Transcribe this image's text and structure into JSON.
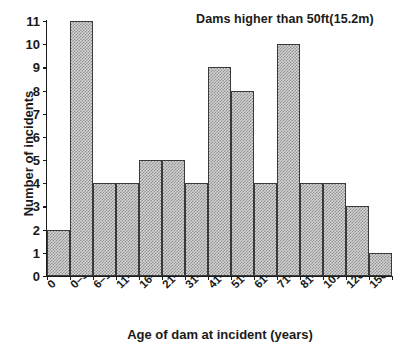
{
  "chart_data": {
    "type": "bar",
    "title": "Dams higher than 50ft(15.2m)",
    "xlabel": "Age of dam at incident (years)",
    "ylabel": "Number of incidents",
    "categories": [
      "0",
      "0–5",
      "6–10",
      "11–15",
      "16–20",
      "21–30",
      "31–40",
      "41–50",
      "51–60",
      "61–70",
      "71–80",
      "81–100",
      "101–125",
      "126–150",
      "150"
    ],
    "values": [
      2,
      11,
      4,
      4,
      5,
      5,
      4,
      9,
      8,
      4,
      10,
      4,
      4,
      3,
      1
    ],
    "ylim": [
      0,
      11
    ],
    "xlim": [
      0,
      15
    ],
    "yticks": [
      0,
      1,
      2,
      3,
      4,
      5,
      6,
      7,
      8,
      9,
      10,
      11
    ],
    "ytick_labels": [
      "0",
      "1",
      "2",
      "3",
      "4",
      "5",
      "6",
      "7",
      "8",
      "9",
      "10",
      "11"
    ],
    "grid": false,
    "legend": false,
    "legend_position": "none",
    "bar_fill_color": "#d4d4d4",
    "bar_edge_color": "#3a3a3a",
    "axis_color": "#1a1a1a",
    "background_color": "#ffffff",
    "annotations": [
      {
        "text": "Dams higher than 50ft(15.2m)",
        "position": "top-right"
      }
    ]
  }
}
